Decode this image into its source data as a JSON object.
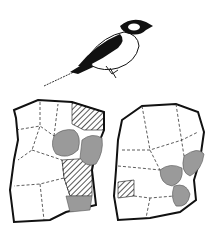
{
  "illustration": {
    "bird": {
      "label": "perched-bird"
    },
    "maps": [
      {
        "label": "territory-map-left",
        "legend": {
          "hatched": "hatched-territories",
          "shaded": "gray-territories"
        }
      },
      {
        "label": "territory-map-right"
      }
    ],
    "colors": {
      "ink": "#111111",
      "shade": "#9a9a9a",
      "paper": "#ffffff"
    }
  }
}
